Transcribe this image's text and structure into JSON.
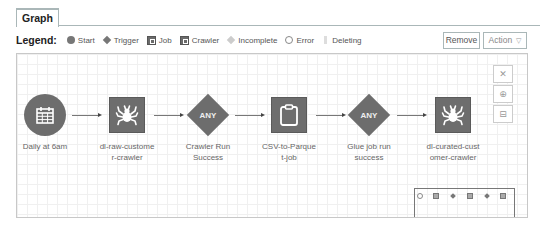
{
  "tabs": [
    {
      "label": "Graph",
      "active": true
    }
  ],
  "legend": {
    "title": "Legend:",
    "items": [
      {
        "label": "Start",
        "icon": "circle-icon"
      },
      {
        "label": "Trigger",
        "icon": "diamond-icon"
      },
      {
        "label": "Job",
        "icon": "job-square-icon"
      },
      {
        "label": "Crawler",
        "icon": "crawler-square-icon"
      },
      {
        "label": "Incomplete",
        "icon": "incomplete-diamond-icon"
      },
      {
        "label": "Error",
        "icon": "error-circle-icon"
      },
      {
        "label": "Deleting",
        "icon": "deleting-bar-icon"
      }
    ]
  },
  "toolbar": {
    "remove_label": "Remove",
    "action_label": "Action",
    "action_caret": "▽"
  },
  "graph": {
    "nodes": [
      {
        "type": "start",
        "icon": "calendar-icon",
        "label_lines": [
          "Daily at 6am"
        ]
      },
      {
        "type": "crawler",
        "icon": "spider-icon",
        "label_lines": [
          "dl-raw-custome",
          "r-crawler"
        ]
      },
      {
        "type": "trigger",
        "text": "ANY",
        "label_lines": [
          "Crawler Run",
          "Success"
        ]
      },
      {
        "type": "job",
        "icon": "clipboard-icon",
        "label_lines": [
          "CSV-to-Parque",
          "t-job"
        ]
      },
      {
        "type": "trigger",
        "text": "ANY",
        "label_lines": [
          "Glue job run",
          "success"
        ]
      },
      {
        "type": "crawler",
        "icon": "spider-icon",
        "label_lines": [
          "dl-curated-cust",
          "omer-crawler"
        ]
      }
    ],
    "controls": {
      "reset": "✕",
      "zoom_in": "⊕",
      "zoom_out": "⊟"
    },
    "colors": {
      "node_fill": "#6d6d6d",
      "edge": "#777777",
      "grid": "#f0f0f0"
    }
  }
}
